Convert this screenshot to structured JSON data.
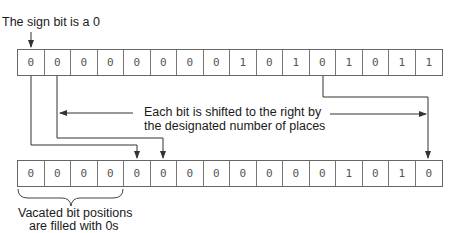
{
  "labels": {
    "sign_bit": "The sign bit is a 0",
    "shift_line1": "Each bit is shifted to the right by",
    "shift_line2": "the designated number of places",
    "vacated_line1": "Vacated bit positions",
    "vacated_line2": "are filled with 0s"
  },
  "top_row": {
    "bits": [
      "0",
      "0",
      "0",
      "0",
      "0",
      "0",
      "0",
      "0",
      "1",
      "0",
      "1",
      "0",
      "1",
      "0",
      "1",
      "1"
    ]
  },
  "bottom_row": {
    "bits": [
      "0",
      "0",
      "0",
      "0",
      "0",
      "0",
      "0",
      "0",
      "0",
      "0",
      "0",
      "0",
      "1",
      "0",
      "1",
      "0"
    ]
  },
  "colors": {
    "line": "#333333",
    "cell_border": "#777777",
    "text": "#1a1a1a"
  }
}
